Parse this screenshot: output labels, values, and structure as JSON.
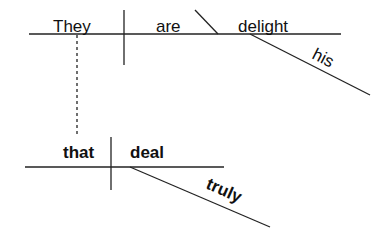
{
  "diagram": {
    "type": "sentence-diagram",
    "main_clause": {
      "subject": "They",
      "verb": "are",
      "predicate_complement": "delight",
      "modifier_of_complement": "his"
    },
    "subordinate_clause": {
      "subject": "that",
      "verb": "deal",
      "adverb_modifier": "truly"
    },
    "connector": "dotted line from 'They' to 'that'"
  },
  "colors": {
    "line": "#222222",
    "text": "#111111",
    "background": "#ffffff"
  }
}
